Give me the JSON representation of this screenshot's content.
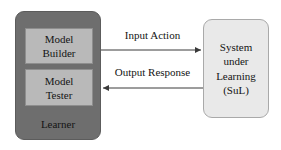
{
  "diagram": {
    "colors": {
      "learner_fill": "#6e6e6e",
      "component_fill": "#b9b9b9",
      "sul_fill": "#e9e9e9",
      "stroke": "#444444",
      "text": "#141414",
      "background": "#ffffff"
    }
  },
  "learner": {
    "label": "Learner",
    "components": [
      {
        "name": "model-builder",
        "line1": "Model",
        "line2": "Builder"
      },
      {
        "name": "model-tester",
        "line1": "Model",
        "line2": "Tester"
      }
    ]
  },
  "sul": {
    "line1": "System",
    "line2": "under",
    "line3": "Learning",
    "line4": "(SuL)"
  },
  "edges": [
    {
      "name": "input-action",
      "label": "Input Action",
      "direction": "right"
    },
    {
      "name": "output-response",
      "label": "Output Response",
      "direction": "left"
    }
  ]
}
